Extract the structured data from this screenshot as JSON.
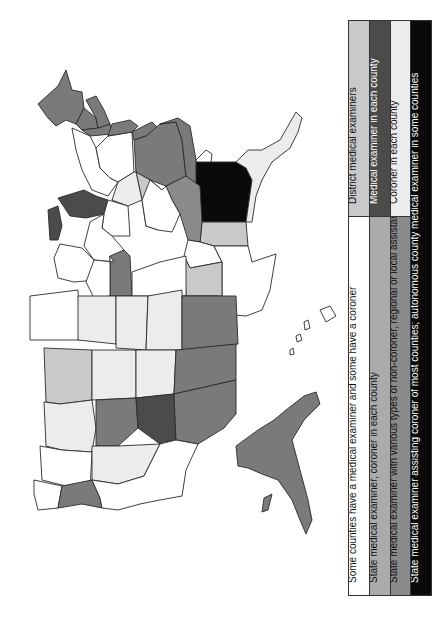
{
  "figure": {
    "orientation": "rotated-90-ccw",
    "map_region": "United States"
  },
  "legend": {
    "columns": [
      {
        "cells": [
          {
            "label": "Some counties have a medical examiner and some have a coroner",
            "color": "#ffffff",
            "dark": false,
            "span": 0.66
          },
          {
            "label": "District medical examiners",
            "color": "#c9c9c9",
            "dark": false,
            "span": 0.34
          }
        ]
      },
      {
        "cells": [
          {
            "label": "State medical examiner, coroner in each county",
            "color": "#ababab",
            "dark": false,
            "span": 0.66
          },
          {
            "label": "Medical examiner in each county",
            "color": "#4b4b4b",
            "dark": true,
            "span": 0.34
          }
        ]
      },
      {
        "cells": [
          {
            "label": "State medical examiner with various types of non-coroner, regional or local assistance",
            "color": "#8a8a8a",
            "dark": false,
            "span": 0.66
          },
          {
            "label": "Coroner in each county",
            "color": "#ececec",
            "dark": false,
            "span": 0.34
          }
        ]
      },
      {
        "cells": [
          {
            "label": "State medical examiner assisting coroner of most counties; autonomous county medical examiner in some counties",
            "color": "#0a0a0a",
            "dark": true,
            "span": 1.0
          }
        ]
      }
    ]
  },
  "categories": {
    "mixed": "#ffffff",
    "district_me": "#c9c9c9",
    "state_me_coroner": "#ababab",
    "me_each_county": "#4b4b4b",
    "state_me_assist": "#8a8a8a",
    "coroner_each_county": "#ececec",
    "state_me_assisting_coroner": "#0a0a0a"
  }
}
